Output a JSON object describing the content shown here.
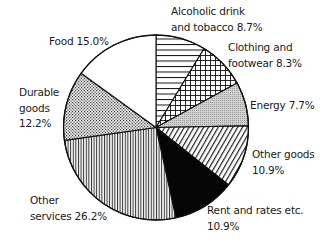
{
  "chart_data": {
    "type": "pie",
    "title": "",
    "start_angle_deg": -90,
    "direction": "clockwise",
    "center": [
      156,
      127.5
    ],
    "radius": 92.5,
    "categories": [
      "Alcoholic drink and tobacco",
      "Clothing and footwear",
      "Energy",
      "Other goods",
      "Rent and rates etc.",
      "Other services",
      "Durable goods",
      "Food"
    ],
    "values": [
      8.7,
      8.3,
      7.7,
      10.9,
      10.9,
      26.2,
      12.2,
      15.0
    ],
    "unit": "%",
    "fills": [
      "horizontal-lines",
      "crosshatch",
      "fine-dots-grey",
      "diagonal-lines",
      "solid-black",
      "vertical-lines",
      "dots",
      "white"
    ],
    "legend": "none (direct labels)"
  },
  "labels": [
    {
      "lines": [
        "Alcoholic drink",
        "and tobacco 8.7%"
      ],
      "x": 171,
      "y": 4
    },
    {
      "lines": [
        "Clothing and",
        "footwear 8.3%"
      ],
      "x": 228,
      "y": 40
    },
    {
      "lines": [
        "Energy 7.7%"
      ],
      "x": 250,
      "y": 98
    },
    {
      "lines": [
        "Other goods",
        "10.9%"
      ],
      "x": 252,
      "y": 147
    },
    {
      "lines": [
        "Rent and rates etc.",
        "10.9%"
      ],
      "x": 207,
      "y": 203
    },
    {
      "lines": [
        "Other",
        "services 26.2%"
      ],
      "x": 30,
      "y": 193
    },
    {
      "lines": [
        "Durable",
        "goods",
        "12.2%"
      ],
      "x": 19,
      "y": 85
    },
    {
      "lines": [
        "Food 15.0%"
      ],
      "x": 49,
      "y": 34
    }
  ]
}
